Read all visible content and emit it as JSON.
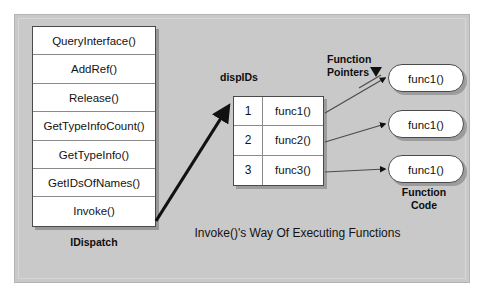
{
  "diagram": {
    "caption": "Invoke()'s Way Of Executing Functions",
    "panel_bg": "#c9c9c9"
  },
  "idispatch": {
    "caption": "IDispatch",
    "methods": [
      "QueryInterface()",
      "AddRef()",
      "Release()",
      "GetTypeInfoCount()",
      "GetTypeInfo()",
      "GetIDsOfNames()",
      "Invoke()"
    ]
  },
  "dispids": {
    "label": "dispIDs",
    "rows": [
      {
        "id": "1",
        "func": "func1()"
      },
      {
        "id": "2",
        "func": "func2()"
      },
      {
        "id": "3",
        "func": "func3()"
      }
    ]
  },
  "function_pointers": {
    "label_line1": "Function",
    "label_line2": "Pointers"
  },
  "function_code": {
    "label_line1": "Function",
    "label_line2": "Code",
    "ovals": [
      "func1()",
      "func1()",
      "func1()"
    ]
  }
}
